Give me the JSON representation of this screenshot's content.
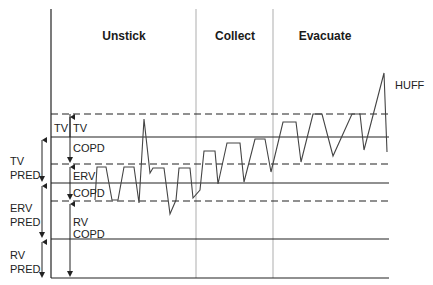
{
  "diagram": {
    "phases": [
      {
        "label": "Unstick",
        "x": 124
      },
      {
        "label": "Collect",
        "x": 235
      },
      {
        "label": "Evacuate",
        "x": 325
      }
    ],
    "annotation_huff": "HUFF",
    "inner_labels": {
      "tv_left": "TV",
      "tv_right": "TV",
      "tv_copd": "COPD",
      "erv": "ERV",
      "erv_copd": "COPD",
      "rv": "RV",
      "rv_copd": "COPD"
    },
    "outer_labels": {
      "tv_pred_1": "TV",
      "tv_pred_2": "PRED",
      "erv_pred_1": "ERV",
      "erv_pred_2": "PRED",
      "rv_pred_1": "RV",
      "rv_pred_2": "PRED"
    },
    "levels": {
      "tv_copd_top_dashed": 114,
      "tv_pred_top_solid": 137,
      "erv_copd_top_dashed": 164,
      "erv_pred_top_solid": 183,
      "rv_copd_top_dashed": 201,
      "rv_pred_top_solid": 239,
      "baseline": 278
    },
    "colors": {
      "line": "#222222",
      "divider": "#bbbbbb",
      "waveform": "#444444"
    },
    "waveform_points": "95,200 97,167 106,167 112,200 118,200 124,167 134,167 139,203 144,119 150,173 153,168 164,168 170,214 176,200 179,168 190,168 193,198 200,190 204,151 215,151 218,184 227,143 240,143 244,182 255,139 265,139 271,172 283,122 296,122 301,162 313,114 322,114 333,156 352,114 360,114 364,150 384,73 387,152"
  }
}
